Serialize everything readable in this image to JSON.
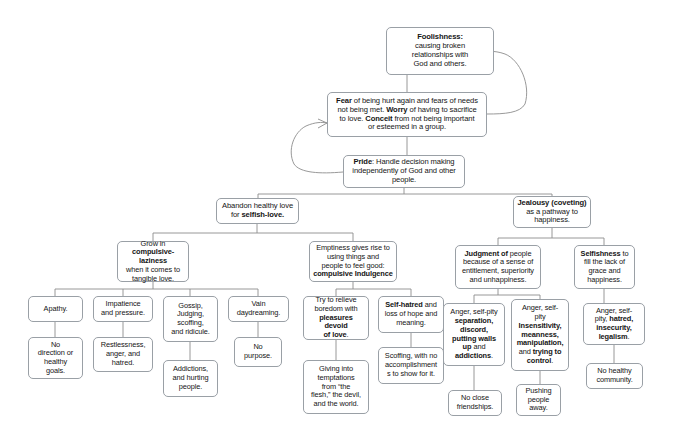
{
  "diagram": {
    "type": "flowchart",
    "background_color": "#ffffff",
    "node_border_color": "#9aa0a6",
    "edge_color": "#8d8d8d",
    "nodes": [
      {
        "id": "foolishness",
        "name": "node-foolishness",
        "text_html": "<b>Foolishness:</b><br>causing broken<br>relationships with<br>God and others.",
        "x": 386,
        "y": 27,
        "w": 108,
        "h": 48,
        "font_size": 7.6
      },
      {
        "id": "fear",
        "name": "node-fear-worry-conceit",
        "text_html": "<b>Fear</b> of being hurt again and fears of needs<br>not being met. <b>Worry</b> of having to sacrifice<br>to love. <b>Conceit</b> from not being important<br>or esteemed in a group.",
        "x": 327,
        "y": 92,
        "w": 160,
        "h": 45,
        "font_size": 7.6
      },
      {
        "id": "pride",
        "name": "node-pride",
        "text_html": "<b>Pride</b>: Handle decision making<br>independently of God and other<br>people.",
        "x": 343,
        "y": 155,
        "w": 122,
        "h": 33,
        "font_size": 7.6
      },
      {
        "id": "abandon-love",
        "name": "node-abandon-healthy-love",
        "text_html": "Abandon healthy love<br>for <b>selfish-love.</b>",
        "x": 216,
        "y": 198,
        "w": 83,
        "h": 26,
        "font_size": 7.6
      },
      {
        "id": "jealousy",
        "name": "node-jealousy-coveting",
        "text_html": "<b>Jealousy (coveting)</b><br>as a pathway to<br>happiness.",
        "x": 513,
        "y": 196,
        "w": 78,
        "h": 32,
        "font_size": 7.6
      },
      {
        "id": "compulsive-laziness",
        "name": "node-compulsive-laziness",
        "text_html": "Grow in<br><b>compulsive-laziness</b><br>when it comes to<br>tangible love.",
        "x": 117,
        "y": 241,
        "w": 72,
        "h": 41,
        "font_size": 7.4
      },
      {
        "id": "emptiness",
        "name": "node-emptiness-compulsive-indulgence",
        "text_html": "Emptiness gives rise to<br>using things and<br>people to feel good:<br><b>compulsive Indulgence</b>",
        "x": 309,
        "y": 241,
        "w": 88,
        "h": 41,
        "font_size": 7.4
      },
      {
        "id": "judgment",
        "name": "node-judgment-of-people",
        "text_html": "<b>Judgment of</b> people<br>because of a sense of<br>entitlement, superiority<br>and unhappiness.",
        "x": 455,
        "y": 245,
        "w": 86,
        "h": 44,
        "font_size": 7.4
      },
      {
        "id": "selfishness",
        "name": "node-selfishness",
        "text_html": "<b>Selfishness</b> to<br>fill the lack of<br>grace and<br>happiness.",
        "x": 574,
        "y": 245,
        "w": 61,
        "h": 44,
        "font_size": 7.4
      },
      {
        "id": "apathy",
        "name": "node-apathy",
        "text_html": "Apathy.",
        "x": 28,
        "y": 296,
        "w": 55,
        "h": 26,
        "font_size": 7.4
      },
      {
        "id": "impatience",
        "name": "node-impatience-and-pressure",
        "text_html": "Impatience<br>and pressure.",
        "x": 93,
        "y": 296,
        "w": 60,
        "h": 26,
        "font_size": 7.4
      },
      {
        "id": "gossip",
        "name": "node-gossip-judging-scoffing",
        "text_html": "Gossip,<br>Judging,<br>scoffing,<br>and ridicule.",
        "x": 163,
        "y": 296,
        "w": 55,
        "h": 46,
        "font_size": 7.4
      },
      {
        "id": "vain-daydreaming",
        "name": "node-vain-daydreaming",
        "text_html": "Vain<br>daydreaming.",
        "x": 228,
        "y": 296,
        "w": 61,
        "h": 26,
        "font_size": 7.4
      },
      {
        "id": "relieve-boredom",
        "name": "node-relieve-boredom",
        "text_html": "Try to relieve<br>boredom with<br><b>pleasures devoid<br>of love</b>.",
        "x": 303,
        "y": 296,
        "w": 66,
        "h": 44,
        "font_size": 7.4
      },
      {
        "id": "self-hatred",
        "name": "node-self-hatred",
        "text_html": "<b>Self-hatred</b> and<br>loss of hope and<br>meaning.",
        "x": 378,
        "y": 296,
        "w": 66,
        "h": 37,
        "font_size": 7.4
      },
      {
        "id": "anger-separation",
        "name": "node-anger-separation-discord",
        "text_html": "Anger, self-pity<br><b>separation,<br>discord,<br>putting walls<br>up</b> and<br><b>addictions</b>.",
        "x": 443,
        "y": 303,
        "w": 62,
        "h": 63,
        "font_size": 7.4
      },
      {
        "id": "anger-insensitivity",
        "name": "node-anger-insensitivity-manipulation",
        "text_html": "Anger, self-<br>pity<br><b>Insensitivity,<br>meanness,<br>manipulation,</b><br>and <b>trying to<br>control</b>.",
        "x": 511,
        "y": 299,
        "w": 58,
        "h": 72,
        "font_size": 7.4
      },
      {
        "id": "anger-hatred",
        "name": "node-anger-hatred-insecurity-legalism",
        "text_html": "Anger, self-<br>pity, <b>hatred,<br>insecurity,<br>legalism</b>.",
        "x": 583,
        "y": 303,
        "w": 62,
        "h": 42,
        "font_size": 7.4
      },
      {
        "id": "no-direction",
        "name": "node-no-direction-healthy-goals",
        "text_html": "No<br>direction or<br>healthy<br>goals.",
        "x": 28,
        "y": 337,
        "w": 55,
        "h": 42,
        "font_size": 7.4
      },
      {
        "id": "restlessness",
        "name": "node-restlessness-anger-hatred",
        "text_html": "Restlessness,<br>anger, and<br>hatred.",
        "x": 93,
        "y": 337,
        "w": 60,
        "h": 35,
        "font_size": 7.4
      },
      {
        "id": "addictions",
        "name": "node-addictions-hurting-people",
        "text_html": "Addictions,<br>and hurting<br>people.",
        "x": 163,
        "y": 360,
        "w": 55,
        "h": 37,
        "font_size": 7.4
      },
      {
        "id": "no-purpose",
        "name": "node-no-purpose",
        "text_html": "No<br>purpose.",
        "x": 234,
        "y": 337,
        "w": 48,
        "h": 30,
        "font_size": 7.4
      },
      {
        "id": "giving-into-temptations",
        "name": "node-giving-into-temptations",
        "text_html": "Giving into<br>temptations<br>from “the<br>flesh,” the devil,<br>and the world.",
        "x": 303,
        "y": 360,
        "w": 66,
        "h": 54,
        "font_size": 7.4
      },
      {
        "id": "scoffing",
        "name": "node-scoffing-no-accomplishments",
        "text_html": "Scoffing, with no<br>accomplishment<br>s to show for it.",
        "x": 378,
        "y": 347,
        "w": 66,
        "h": 37,
        "font_size": 7.4
      },
      {
        "id": "no-close-friendships",
        "name": "node-no-close-friendships",
        "text_html": "No close<br>friendships.",
        "x": 448,
        "y": 390,
        "w": 54,
        "h": 26,
        "font_size": 7.4
      },
      {
        "id": "pushing-people-away",
        "name": "node-pushing-people-away",
        "text_html": "Pushing<br>people<br>away.",
        "x": 516,
        "y": 384,
        "w": 45,
        "h": 32,
        "font_size": 7.4
      },
      {
        "id": "no-healthy-community",
        "name": "node-no-healthy-community",
        "text_html": "No healthy<br>community.",
        "x": 586,
        "y": 363,
        "w": 57,
        "h": 26,
        "font_size": 7.4
      }
    ],
    "edges": [
      {
        "name": "edge-foolishness-to-fear",
        "from": "foolishness",
        "to": "fear"
      },
      {
        "name": "edge-fear-to-pride",
        "from": "fear",
        "to": "pride"
      },
      {
        "name": "edge-pride-to-abandon-love",
        "from": "pride",
        "to": "abandon-love"
      },
      {
        "name": "edge-pride-to-jealousy",
        "from": "pride",
        "to": "jealousy"
      },
      {
        "name": "edge-abandon-to-compulsive-laziness",
        "from": "abandon-love",
        "to": "compulsive-laziness"
      },
      {
        "name": "edge-abandon-to-emptiness",
        "from": "abandon-love",
        "to": "emptiness"
      },
      {
        "name": "edge-jealousy-to-judgment",
        "from": "jealousy",
        "to": "judgment"
      },
      {
        "name": "edge-jealousy-to-selfishness",
        "from": "jealousy",
        "to": "selfishness"
      },
      {
        "name": "edge-laziness-to-apathy",
        "from": "compulsive-laziness",
        "to": "apathy"
      },
      {
        "name": "edge-laziness-to-impatience",
        "from": "compulsive-laziness",
        "to": "impatience"
      },
      {
        "name": "edge-laziness-to-gossip",
        "from": "compulsive-laziness",
        "to": "gossip"
      },
      {
        "name": "edge-laziness-to-vain-daydreaming",
        "from": "compulsive-laziness",
        "to": "vain-daydreaming"
      },
      {
        "name": "edge-emptiness-to-relieve-boredom",
        "from": "emptiness",
        "to": "relieve-boredom"
      },
      {
        "name": "edge-emptiness-to-self-hatred",
        "from": "emptiness",
        "to": "self-hatred"
      },
      {
        "name": "edge-judgment-to-anger-separation",
        "from": "judgment",
        "to": "anger-separation"
      },
      {
        "name": "edge-judgment-to-anger-insensitivity",
        "from": "judgment",
        "to": "anger-insensitivity"
      },
      {
        "name": "edge-selfishness-to-anger-hatred",
        "from": "selfishness",
        "to": "anger-hatred"
      },
      {
        "name": "edge-apathy-to-no-direction",
        "from": "apathy",
        "to": "no-direction"
      },
      {
        "name": "edge-impatience-to-restlessness",
        "from": "impatience",
        "to": "restlessness"
      },
      {
        "name": "edge-gossip-to-addictions",
        "from": "gossip",
        "to": "addictions"
      },
      {
        "name": "edge-vain-to-no-purpose",
        "from": "vain-daydreaming",
        "to": "no-purpose"
      },
      {
        "name": "edge-relieve-to-temptations",
        "from": "relieve-boredom",
        "to": "giving-into-temptations"
      },
      {
        "name": "edge-self-hatred-to-scoffing",
        "from": "self-hatred",
        "to": "scoffing"
      },
      {
        "name": "edge-anger-separation-to-no-close-friendships",
        "from": "anger-separation",
        "to": "no-close-friendships"
      },
      {
        "name": "edge-anger-insensitivity-to-pushing-people-away",
        "from": "anger-insensitivity",
        "to": "pushing-people-away"
      },
      {
        "name": "edge-anger-hatred-to-no-healthy-community",
        "from": "anger-hatred",
        "to": "no-healthy-community"
      },
      {
        "name": "edge-feedback-right-loop",
        "from": "fear",
        "to": "foolishness",
        "style": "curved-arrow"
      },
      {
        "name": "edge-feedback-left-loop",
        "from": "pride",
        "to": "fear",
        "style": "curved-arrow"
      }
    ]
  }
}
